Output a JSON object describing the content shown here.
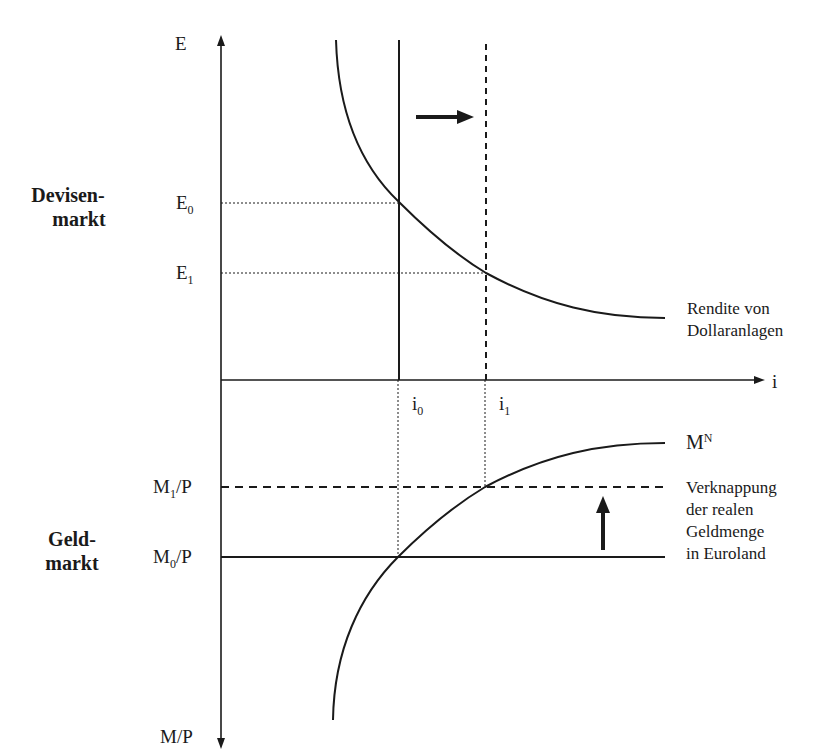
{
  "diagram": {
    "top_panel": {
      "name_line1": "Devisen-",
      "name_line2": "markt",
      "y_axis_label": "E",
      "levels": [
        {
          "base": "E",
          "sub": "0"
        },
        {
          "base": "E",
          "sub": "1"
        }
      ],
      "curve_label_line1": "Rendite von",
      "curve_label_line2": "Dollaranlagen"
    },
    "shared_axis": {
      "x_axis_label": "i",
      "ticks": [
        {
          "base": "i",
          "sub": "0"
        },
        {
          "base": "i",
          "sub": "1"
        }
      ]
    },
    "bottom_panel": {
      "name_line1": "Geld-",
      "name_line2": "markt",
      "y_axis_label": "M/P",
      "levels": [
        {
          "base": "M",
          "sub": "1",
          "suffix": "/P"
        },
        {
          "base": "M",
          "sub": "0",
          "suffix": "/P"
        }
      ],
      "curve_label_base": "M",
      "curve_label_sup": "N",
      "shift_label_lines": [
        "Verknappung",
        "der realen",
        "Geldmenge",
        "in Euroland"
      ]
    },
    "colors": {
      "line": "#1a1a1a",
      "background": "#ffffff"
    }
  }
}
